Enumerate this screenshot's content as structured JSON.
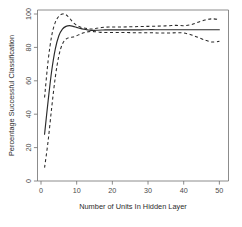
{
  "chart_data": {
    "type": "line",
    "title": "",
    "subtitle": "",
    "xlabel": "Number of Units In Hidden Layer",
    "ylabel": "Percentage Successful Classification",
    "xlim": [
      0,
      52
    ],
    "ylim": [
      0,
      103
    ],
    "xticks": [
      0,
      10,
      20,
      30,
      40,
      50
    ],
    "yticks": [
      0,
      20,
      40,
      60,
      80,
      100
    ],
    "xtick_labels": [
      "0",
      "10",
      "20",
      "30",
      "40",
      "50"
    ],
    "ytick_labels": [
      "0",
      "20",
      "40",
      "60",
      "80",
      "100"
    ],
    "grid": false,
    "legend": null,
    "legend_position": "none",
    "frame": "box",
    "annotations": [],
    "x": [
      1,
      2,
      3,
      4,
      5,
      6,
      7,
      8,
      9,
      10,
      11,
      12,
      13,
      14,
      15,
      16,
      17,
      18,
      19,
      20,
      22,
      24,
      26,
      28,
      30,
      32,
      34,
      36,
      38,
      40,
      42,
      44,
      46,
      48,
      50
    ],
    "series": [
      {
        "name": "Mean percentage successful classification",
        "style": "solid",
        "values": [
          28.0,
          48.0,
          66.0,
          79.0,
          87.0,
          91.0,
          92.6,
          93.0,
          92.6,
          92.0,
          91.4,
          90.9,
          90.5,
          90.2,
          90.2,
          90.3,
          90.4,
          90.5,
          90.5,
          90.5,
          90.5,
          90.5,
          90.5,
          90.5,
          90.6,
          90.6,
          90.6,
          90.6,
          90.6,
          90.6,
          90.6,
          90.6,
          90.6,
          90.6,
          90.6
        ]
      },
      {
        "name": "Upper confidence band",
        "style": "dashed",
        "values": [
          50.0,
          72.0,
          87.0,
          95.0,
          98.6,
          100.0,
          99.6,
          97.5,
          95.0,
          93.2,
          92.2,
          91.6,
          91.2,
          91.0,
          91.2,
          91.6,
          91.9,
          92.1,
          92.2,
          92.2,
          92.2,
          92.3,
          92.4,
          92.5,
          92.6,
          92.7,
          92.8,
          93.0,
          93.2,
          93.0,
          93.6,
          95.0,
          96.4,
          97.1,
          96.6
        ]
      },
      {
        "name": "Lower confidence band",
        "style": "dashed",
        "values": [
          8.0,
          24.0,
          44.0,
          62.0,
          75.0,
          82.0,
          85.0,
          86.0,
          86.2,
          87.0,
          88.0,
          88.8,
          89.3,
          89.5,
          89.4,
          89.2,
          89.0,
          88.9,
          88.9,
          88.9,
          88.9,
          88.9,
          88.8,
          88.8,
          88.8,
          88.7,
          88.6,
          88.6,
          88.8,
          88.6,
          87.6,
          86.0,
          84.4,
          83.2,
          83.6
        ]
      }
    ]
  }
}
